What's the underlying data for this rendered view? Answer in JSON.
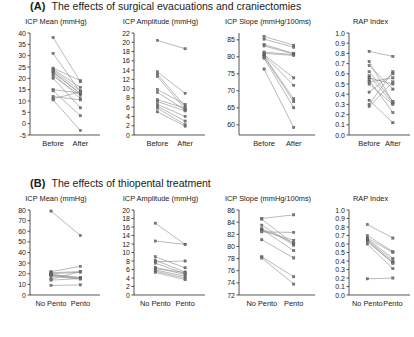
{
  "figure": {
    "panels": [
      {
        "letter": "(A)",
        "title": "The effects of surgical evacuations and craniectomies",
        "name": "panel-a"
      },
      {
        "letter": "(B)",
        "title": "The effects of thiopental treatment",
        "name": "panel-b"
      }
    ]
  },
  "chart_data": [
    {
      "type": "line",
      "panel": "A",
      "index": 0,
      "title": "ICP Mean (mmHg)",
      "xlabel": "",
      "ylabel": "",
      "categories": [
        "Before",
        "After"
      ],
      "ylim": [
        -5,
        40
      ],
      "yticks": [
        -5,
        0,
        5,
        10,
        15,
        20,
        25,
        30,
        35,
        40
      ],
      "ytick_labels": [
        "-5",
        "0",
        "5",
        "10",
        "15",
        "20",
        "25",
        "30",
        "35",
        "40"
      ],
      "grid": false,
      "legend": "none",
      "series": [
        {
          "name": "subject-1",
          "values": [
            38.0,
            18.5
          ]
        },
        {
          "name": "subject-2",
          "values": [
            31.0,
            14.0
          ]
        },
        {
          "name": "subject-3",
          "values": [
            24.5,
            19.0
          ]
        },
        {
          "name": "subject-4",
          "values": [
            24.0,
            16.0
          ]
        },
        {
          "name": "subject-5",
          "values": [
            23.5,
            14.5
          ]
        },
        {
          "name": "subject-6",
          "values": [
            23.0,
            13.0
          ]
        },
        {
          "name": "subject-7",
          "values": [
            22.5,
            13.5
          ]
        },
        {
          "name": "subject-8",
          "values": [
            22.0,
            11.0
          ]
        },
        {
          "name": "subject-9",
          "values": [
            21.0,
            12.5
          ]
        },
        {
          "name": "subject-10",
          "values": [
            20.0,
            7.0
          ]
        },
        {
          "name": "subject-11",
          "values": [
            15.0,
            13.5
          ]
        },
        {
          "name": "subject-12",
          "values": [
            14.5,
            3.5
          ]
        },
        {
          "name": "subject-13",
          "values": [
            12.0,
            10.5
          ]
        },
        {
          "name": "subject-14",
          "values": [
            11.0,
            14.0
          ]
        },
        {
          "name": "subject-15",
          "values": [
            10.5,
            -3.0
          ]
        }
      ]
    },
    {
      "type": "line",
      "panel": "A",
      "index": 1,
      "title": "ICP Amplitude (mmHg)",
      "xlabel": "",
      "ylabel": "",
      "categories": [
        "Before",
        "After"
      ],
      "ylim": [
        0,
        22
      ],
      "yticks": [
        0,
        2,
        4,
        6,
        8,
        10,
        12,
        14,
        16,
        18,
        20,
        22
      ],
      "ytick_labels": [
        "0",
        "2",
        "4",
        "6",
        "8",
        "10",
        "12",
        "14",
        "16",
        "18",
        "20",
        "22"
      ],
      "grid": false,
      "legend": "none",
      "series": [
        {
          "name": "subject-1",
          "values": [
            20.4,
            18.6
          ]
        },
        {
          "name": "subject-2",
          "values": [
            13.6,
            9.0
          ]
        },
        {
          "name": "subject-3",
          "values": [
            13.1,
            6.2
          ]
        },
        {
          "name": "subject-4",
          "values": [
            12.6,
            5.6
          ]
        },
        {
          "name": "subject-5",
          "values": [
            9.8,
            6.6
          ]
        },
        {
          "name": "subject-6",
          "values": [
            9.2,
            5.4
          ]
        },
        {
          "name": "subject-7",
          "values": [
            7.6,
            5.8
          ]
        },
        {
          "name": "subject-8",
          "values": [
            7.2,
            5.2
          ]
        },
        {
          "name": "subject-9",
          "values": [
            6.6,
            4.0
          ]
        },
        {
          "name": "subject-10",
          "values": [
            6.2,
            3.0
          ]
        },
        {
          "name": "subject-11",
          "values": [
            5.8,
            2.2
          ]
        },
        {
          "name": "subject-12",
          "values": [
            5.0,
            1.9
          ]
        }
      ]
    },
    {
      "type": "line",
      "panel": "A",
      "index": 2,
      "title": "ICP Slope (mmHg/100ms)",
      "xlabel": "",
      "ylabel": "",
      "categories": [
        "Before",
        "After"
      ],
      "ylim": [
        57,
        87
      ],
      "yticks": [
        60,
        65,
        70,
        75,
        80,
        85
      ],
      "ytick_labels": [
        "60",
        "65",
        "70",
        "75",
        "80",
        "85"
      ],
      "grid": false,
      "legend": "none",
      "series": [
        {
          "name": "subject-1",
          "values": [
            86.0,
            83.4
          ]
        },
        {
          "name": "subject-2",
          "values": [
            85.2,
            82.8
          ]
        },
        {
          "name": "subject-3",
          "values": [
            83.6,
            81.0
          ]
        },
        {
          "name": "subject-4",
          "values": [
            83.2,
            80.8
          ]
        },
        {
          "name": "subject-5",
          "values": [
            81.4,
            80.6
          ]
        },
        {
          "name": "subject-6",
          "values": [
            81.0,
            80.4
          ]
        },
        {
          "name": "subject-7",
          "values": [
            80.6,
            73.8
          ]
        },
        {
          "name": "subject-8",
          "values": [
            80.4,
            71.6
          ]
        },
        {
          "name": "subject-9",
          "values": [
            80.2,
            67.6
          ]
        },
        {
          "name": "subject-10",
          "values": [
            80.0,
            66.8
          ]
        },
        {
          "name": "subject-11",
          "values": [
            79.6,
            65.0
          ]
        },
        {
          "name": "subject-12",
          "values": [
            76.4,
            59.2
          ]
        }
      ]
    },
    {
      "type": "line",
      "panel": "A",
      "index": 3,
      "title": "RAP Index",
      "xlabel": "",
      "ylabel": "",
      "categories": [
        "Before",
        "After"
      ],
      "ylim": [
        0.0,
        1.0
      ],
      "yticks": [
        0.0,
        0.1,
        0.2,
        0.3,
        0.4,
        0.5,
        0.6,
        0.7,
        0.8,
        0.9,
        1.0
      ],
      "ytick_labels": [
        "0.0",
        "0.1",
        "0.2",
        "0.3",
        "0.4",
        "0.5",
        "0.6",
        "0.7",
        "0.8",
        "0.9",
        "1.0"
      ],
      "grid": false,
      "legend": "none",
      "series": [
        {
          "name": "subject-1",
          "values": [
            0.82,
            0.77
          ]
        },
        {
          "name": "subject-2",
          "values": [
            0.72,
            0.32
          ]
        },
        {
          "name": "subject-3",
          "values": [
            0.68,
            0.45
          ]
        },
        {
          "name": "subject-4",
          "values": [
            0.62,
            0.33
          ]
        },
        {
          "name": "subject-5",
          "values": [
            0.58,
            0.31
          ]
        },
        {
          "name": "subject-6",
          "values": [
            0.56,
            0.5
          ]
        },
        {
          "name": "subject-7",
          "values": [
            0.54,
            0.22
          ]
        },
        {
          "name": "subject-8",
          "values": [
            0.52,
            0.56
          ]
        },
        {
          "name": "subject-9",
          "values": [
            0.5,
            0.3
          ]
        },
        {
          "name": "subject-10",
          "values": [
            0.42,
            0.6
          ]
        },
        {
          "name": "subject-11",
          "values": [
            0.34,
            0.12
          ]
        },
        {
          "name": "subject-12",
          "values": [
            0.3,
            0.62
          ]
        },
        {
          "name": "subject-13",
          "values": [
            0.28,
            0.52
          ]
        }
      ]
    },
    {
      "type": "line",
      "panel": "B",
      "index": 0,
      "title": "ICP Mean (mmHg)",
      "xlabel": "",
      "ylabel": "",
      "categories": [
        "No Pento",
        "Pento"
      ],
      "ylim": [
        0,
        80
      ],
      "yticks": [
        0,
        10,
        20,
        30,
        40,
        50,
        60,
        70,
        80
      ],
      "ytick_labels": [
        "0",
        "10",
        "20",
        "30",
        "40",
        "50",
        "60",
        "70",
        "80"
      ],
      "grid": false,
      "legend": "none",
      "series": [
        {
          "name": "subject-1",
          "values": [
            79.0,
            56.0
          ]
        },
        {
          "name": "subject-2",
          "values": [
            22.0,
            27.0
          ]
        },
        {
          "name": "subject-3",
          "values": [
            21.0,
            22.0
          ]
        },
        {
          "name": "subject-4",
          "values": [
            20.0,
            21.5
          ]
        },
        {
          "name": "subject-5",
          "values": [
            19.5,
            16.5
          ]
        },
        {
          "name": "subject-6",
          "values": [
            19.0,
            16.0
          ]
        },
        {
          "name": "subject-7",
          "values": [
            18.5,
            15.5
          ]
        },
        {
          "name": "subject-8",
          "values": [
            17.5,
            15.0
          ]
        },
        {
          "name": "subject-9",
          "values": [
            15.0,
            22.0
          ]
        },
        {
          "name": "subject-10",
          "values": [
            14.0,
            15.5
          ]
        },
        {
          "name": "subject-11",
          "values": [
            9.0,
            9.5
          ]
        }
      ]
    },
    {
      "type": "line",
      "panel": "B",
      "index": 1,
      "title": "ICP Amplitude (mmHg)",
      "xlabel": "",
      "ylabel": "",
      "categories": [
        "No Pento",
        "Pento"
      ],
      "ylim": [
        0,
        20
      ],
      "yticks": [
        0,
        2,
        4,
        6,
        8,
        10,
        12,
        14,
        16,
        18,
        20
      ],
      "ytick_labels": [
        "0",
        "2",
        "4",
        "6",
        "8",
        "10",
        "12",
        "14",
        "16",
        "18",
        "20"
      ],
      "grid": false,
      "legend": "none",
      "series": [
        {
          "name": "subject-1",
          "values": [
            16.9,
            11.9
          ]
        },
        {
          "name": "subject-2",
          "values": [
            12.7,
            11.9
          ]
        },
        {
          "name": "subject-3",
          "values": [
            9.0,
            6.4
          ]
        },
        {
          "name": "subject-4",
          "values": [
            8.2,
            5.4
          ]
        },
        {
          "name": "subject-5",
          "values": [
            7.8,
            8.0
          ]
        },
        {
          "name": "subject-6",
          "values": [
            7.5,
            5.0
          ]
        },
        {
          "name": "subject-7",
          "values": [
            6.5,
            4.8
          ]
        },
        {
          "name": "subject-8",
          "values": [
            6.2,
            5.3
          ]
        },
        {
          "name": "subject-9",
          "values": [
            5.9,
            4.4
          ]
        },
        {
          "name": "subject-10",
          "values": [
            5.6,
            4.0
          ]
        },
        {
          "name": "subject-11",
          "values": [
            5.3,
            3.6
          ]
        }
      ]
    },
    {
      "type": "line",
      "panel": "B",
      "index": 2,
      "title": "ICP Slope (mmHg/100ms)",
      "xlabel": "",
      "ylabel": "",
      "categories": [
        "No Pento",
        "Pento"
      ],
      "ylim": [
        72,
        86
      ],
      "yticks": [
        72,
        74,
        76,
        78,
        80,
        82,
        84,
        86
      ],
      "ytick_labels": [
        "72",
        "74",
        "76",
        "78",
        "80",
        "82",
        "84",
        "86"
      ],
      "grid": false,
      "legend": "none",
      "series": [
        {
          "name": "subject-1",
          "values": [
            84.6,
            85.2
          ]
        },
        {
          "name": "subject-2",
          "values": [
            84.5,
            80.4
          ]
        },
        {
          "name": "subject-3",
          "values": [
            83.5,
            80.2
          ]
        },
        {
          "name": "subject-4",
          "values": [
            82.9,
            80.6
          ]
        },
        {
          "name": "subject-5",
          "values": [
            82.8,
            79.3
          ]
        },
        {
          "name": "subject-6",
          "values": [
            82.6,
            81.0
          ]
        },
        {
          "name": "subject-7",
          "values": [
            82.4,
            82.3
          ]
        },
        {
          "name": "subject-8",
          "values": [
            81.1,
            78.1
          ]
        },
        {
          "name": "subject-9",
          "values": [
            78.3,
            75.0
          ]
        },
        {
          "name": "subject-10",
          "values": [
            78.1,
            73.8
          ]
        }
      ]
    },
    {
      "type": "line",
      "panel": "B",
      "index": 3,
      "title": "RAP Index",
      "xlabel": "",
      "ylabel": "",
      "categories": [
        "No Pento",
        "Pento"
      ],
      "ylim": [
        0.0,
        1.0
      ],
      "yticks": [
        0.0,
        0.1,
        0.2,
        0.3,
        0.4,
        0.5,
        0.6,
        0.7,
        0.8,
        0.9,
        1.0
      ],
      "ytick_labels": [
        "0.0",
        "0.1",
        "0.2",
        "0.3",
        "0.4",
        "0.5",
        "0.6",
        "0.7",
        "0.8",
        "0.9",
        "1.0"
      ],
      "grid": false,
      "legend": "none",
      "series": [
        {
          "name": "subject-1",
          "values": [
            0.83,
            0.67
          ]
        },
        {
          "name": "subject-2",
          "values": [
            0.7,
            0.51
          ]
        },
        {
          "name": "subject-3",
          "values": [
            0.67,
            0.5
          ]
        },
        {
          "name": "subject-4",
          "values": [
            0.66,
            0.43
          ]
        },
        {
          "name": "subject-5",
          "values": [
            0.65,
            0.4
          ]
        },
        {
          "name": "subject-6",
          "values": [
            0.64,
            0.38
          ]
        },
        {
          "name": "subject-7",
          "values": [
            0.63,
            0.37
          ]
        },
        {
          "name": "subject-8",
          "values": [
            0.6,
            0.31
          ]
        },
        {
          "name": "subject-9",
          "values": [
            0.19,
            0.2
          ]
        }
      ]
    }
  ],
  "style": {
    "line_color": "#8e8e8e",
    "marker_fill": "#7b7b7b",
    "marker_stroke": "#4a4a4a",
    "axis_color": "#2b2b2b",
    "text_color": "#1a1a1a",
    "background": "#ffffff"
  }
}
